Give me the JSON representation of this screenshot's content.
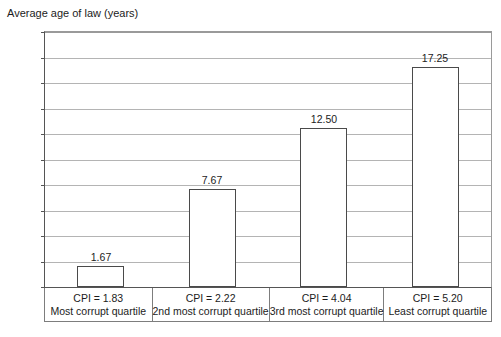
{
  "chart_data": {
    "type": "bar",
    "title": "Average age of law (years)",
    "xlabel": "",
    "ylabel": "",
    "categories": [
      "Most corrupt quartile",
      "2nd most corrupt quartile",
      "3rd most corrupt quartile",
      "Least corrupt quartile"
    ],
    "category_cpi_labels": [
      "CPI = 1.83",
      "CPI = 2.22",
      "CPI = 4.04",
      "CPI = 5.20"
    ],
    "cpi_values": [
      1.83,
      2.22,
      4.04,
      5.2
    ],
    "values": [
      1.67,
      7.67,
      12.5,
      17.25
    ],
    "value_labels": [
      "1.67",
      "7.67",
      "12.50",
      "17.25"
    ],
    "ylim": [
      0.0,
      20.0
    ],
    "ytick_step": 2.0,
    "ytick_labels": [
      "20.0",
      "18.0",
      "16.0",
      "14.0",
      "12.0",
      "10.0",
      "8.0",
      "6.0",
      "4.0",
      "2.0",
      "0.0"
    ],
    "ytick_values": [
      20.0,
      18.0,
      16.0,
      14.0,
      12.0,
      10.0,
      8.0,
      6.0,
      4.0,
      2.0,
      0.0
    ],
    "grid": true,
    "legend": false,
    "legend_position": "none",
    "colors": {
      "bar_fill": "#ffffff",
      "bar_border": "#4a4a4a",
      "gridline": "#b4b4b4",
      "axis": "#555555",
      "text": "#1c1c1c",
      "background": "#ffffff"
    }
  }
}
